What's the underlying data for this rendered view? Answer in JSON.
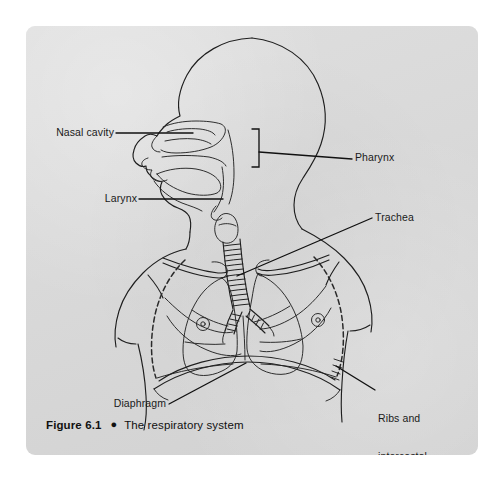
{
  "figure": {
    "caption": {
      "figure_number": "Figure 6.1",
      "bullet": "●",
      "title": "The respiratory system"
    },
    "panel": {
      "background_color": "#d8d8d8",
      "page_color": "#ffffff",
      "ink_color": "#1a1a1a"
    },
    "labels": [
      {
        "id": "nasal-cavity",
        "text": "Nasal cavity",
        "lines": [
          "Nasal cavity"
        ],
        "align": "right",
        "x": 95,
        "y": 102
      },
      {
        "id": "pharynx",
        "text": "Pharynx",
        "lines": [
          "Pharynx"
        ],
        "align": "left",
        "x": 332,
        "y": 127
      },
      {
        "id": "larynx",
        "text": "Larynx",
        "lines": [
          "Larynx"
        ],
        "align": "right",
        "x": 116,
        "y": 168
      },
      {
        "id": "trachea",
        "text": "Trachea",
        "lines": [
          "Trachea"
        ],
        "align": "left",
        "x": 352,
        "y": 187
      },
      {
        "id": "diaphragm",
        "text": "Diaphragm",
        "lines": [
          "Diaphragm"
        ],
        "align": "right",
        "x": 96,
        "y": 372
      },
      {
        "id": "ribs-and-intercostal-muscles",
        "text": "Ribs and intercostal muscles",
        "lines": [
          "Ribs and",
          "intercostal",
          "muscles"
        ],
        "align": "left",
        "x": 352,
        "y": 362
      }
    ],
    "structures": [
      "skull / head profile",
      "nasal cavity",
      "oral cavity and tongue",
      "pharynx",
      "larynx",
      "trachea with cartilage rings",
      "left and right bronchi",
      "left and right lungs",
      "rib cage",
      "clavicles",
      "diaphragm",
      "shoulders and torso outline"
    ]
  }
}
